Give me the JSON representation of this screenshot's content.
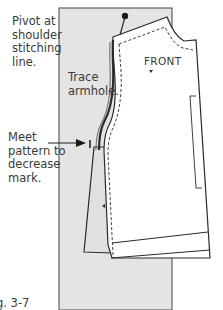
{
  "figure": {
    "caption": "g. 3-7",
    "labels": {
      "pivot": "Pivot at\nshoulder\nstitching\nline.",
      "trace": "Trace\narmhole.",
      "meet": "Meet\npattern to\ndecrease\nmark.",
      "front": "FRONT"
    },
    "colors": {
      "paper_fill": "#e4e4e4",
      "pattern_fill": "#ffffff",
      "outline": "#2a2a2a",
      "pin_head": "#1a1a1a",
      "text": "#3a3a3a"
    },
    "icons": {
      "pin": "pin-icon",
      "arrow": "arrow-right-icon"
    }
  }
}
